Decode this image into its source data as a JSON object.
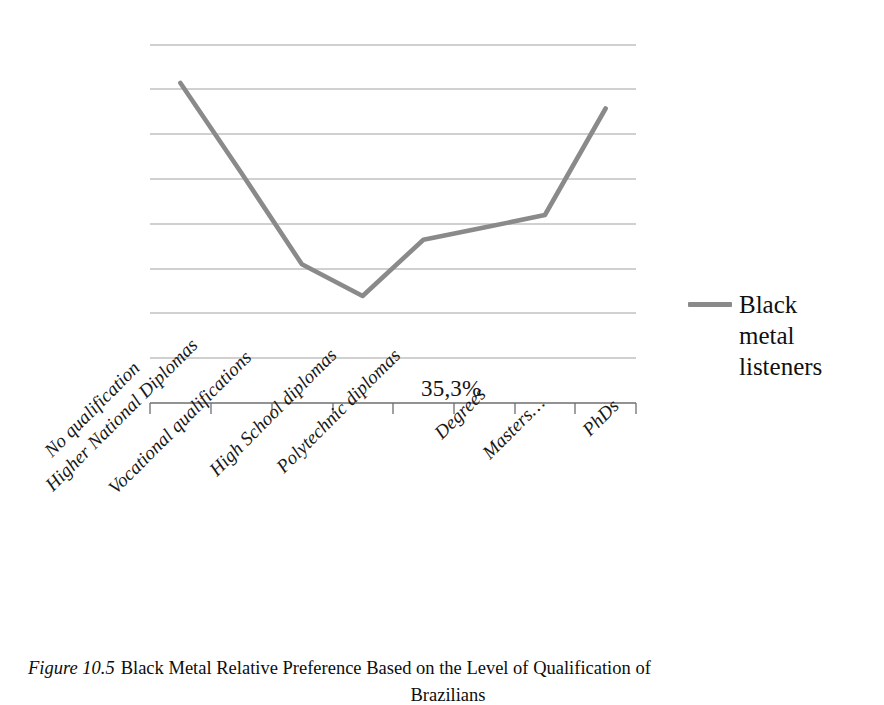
{
  "figure": {
    "caption_number": "Figure 10.5",
    "caption_text": "Black Metal Relative Preference Based on the Level of Qualification of",
    "caption_line2": "Brazilians"
  },
  "legend": {
    "series_label": "Black metal listeners",
    "swatch_color": "#8a8a8a",
    "position": "right"
  },
  "annotations": {
    "point_label": "35,3%"
  },
  "chart_data": {
    "type": "line",
    "title": "",
    "xlabel": "",
    "ylabel": "",
    "grid": true,
    "gridlines": 9,
    "legend_position": "right",
    "series": [
      {
        "name": "Black metal listeners",
        "color": "#8a8a8a",
        "values": [
          71.5,
          51.5,
          31.0,
          23.9,
          36.5,
          39.2,
          42.0,
          65.8
        ]
      }
    ],
    "categories": [
      "No qualification",
      "Higher National Diplomas",
      "Vocational qualifications",
      "High School diplomas",
      "Polytechnic diplomas",
      "Degrees",
      "Masters…",
      "PhDs"
    ],
    "point_labels": [
      "",
      "",
      "",
      "35,3%",
      "",
      "",
      "",
      ""
    ],
    "ylim": [
      0,
      80
    ],
    "xlim": [
      0,
      8
    ]
  }
}
